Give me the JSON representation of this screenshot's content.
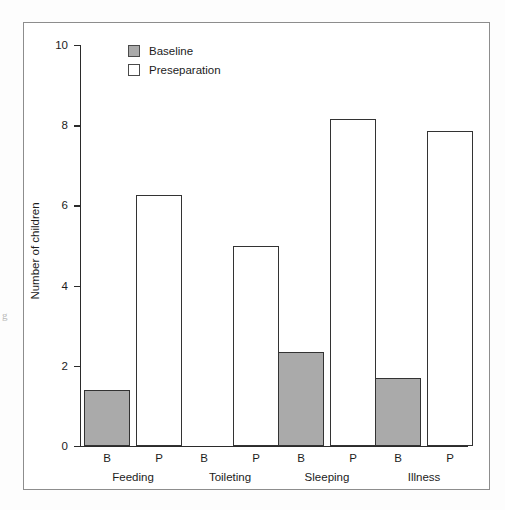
{
  "chart_data": {
    "type": "bar",
    "title": "",
    "xlabel": "",
    "ylabel": "Number of children",
    "ylim": [
      0,
      10
    ],
    "yticks": [
      0,
      2,
      4,
      6,
      8,
      10
    ],
    "ytick_labels": [
      "0",
      "2",
      "4",
      "6",
      "8",
      "10"
    ],
    "grid": false,
    "legend_position": "top-left-inside",
    "categories": [
      "Feeding",
      "Toileting",
      "Sleeping",
      "Illness"
    ],
    "subcategory_labels": [
      "B",
      "P"
    ],
    "series": [
      {
        "name": "Baseline",
        "short_label": "B",
        "color": "#aaaaaa",
        "values": [
          1.4,
          0,
          2.35,
          1.7
        ]
      },
      {
        "name": "Preseparation",
        "short_label": "P",
        "color": "#ffffff",
        "values": [
          6.25,
          5.0,
          8.15,
          7.85
        ]
      }
    ],
    "bars": [
      {
        "group": "Feeding",
        "series": "Baseline",
        "tick": "B",
        "value": 1.4
      },
      {
        "group": "Feeding",
        "series": "Preseparation",
        "tick": "P",
        "value": 6.25
      },
      {
        "group": "Toileting",
        "series": "Baseline",
        "tick": "B",
        "value": 0
      },
      {
        "group": "Toileting",
        "series": "Preseparation",
        "tick": "P",
        "value": 5.0
      },
      {
        "group": "Sleeping",
        "series": "Baseline",
        "tick": "B",
        "value": 2.35
      },
      {
        "group": "Sleeping",
        "series": "Preseparation",
        "tick": "P",
        "value": 8.15
      },
      {
        "group": "Illness",
        "series": "Baseline",
        "tick": "B",
        "value": 1.7
      },
      {
        "group": "Illness",
        "series": "Preseparation",
        "tick": "P",
        "value": 7.85
      }
    ]
  },
  "legend": {
    "items": [
      {
        "label": "Baseline",
        "swatch": "filled-gray"
      },
      {
        "label": "Preseparation",
        "swatch": "outlined-white"
      }
    ]
  },
  "colors": {
    "baseline_fill": "#aaaaaa",
    "preseparation_fill": "#ffffff",
    "bar_outline": "#333333",
    "axis": "#2b2b2b",
    "frame": "#8d8d8d",
    "text": "#1c1c1c"
  },
  "artifact": {
    "margin_glyph": "g"
  }
}
